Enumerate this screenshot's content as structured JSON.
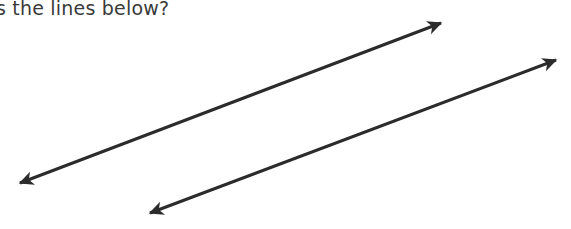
{
  "worksheet": {
    "background_color": "#ffffff",
    "width": 571,
    "height": 229,
    "question_text": "s the lines below?",
    "text_color": "#3a3a3a",
    "text_clipped_left": true,
    "text_clipped_top": true
  },
  "figure": {
    "name": "two-parallel-double-headed-arrows",
    "stroke_color": "#2b2b2b",
    "stroke_width": 3,
    "arrowhead_style": "solid-triangle",
    "lines": [
      {
        "label": "line-1",
        "x1": 9,
        "y1": 187,
        "x2": 451,
        "y2": 19,
        "slope": -0.38,
        "double_headed": true
      },
      {
        "label": "line-2",
        "x1": 139,
        "y1": 217,
        "x2": 567,
        "y2": 56,
        "slope": -0.376,
        "double_headed": true
      }
    ]
  }
}
